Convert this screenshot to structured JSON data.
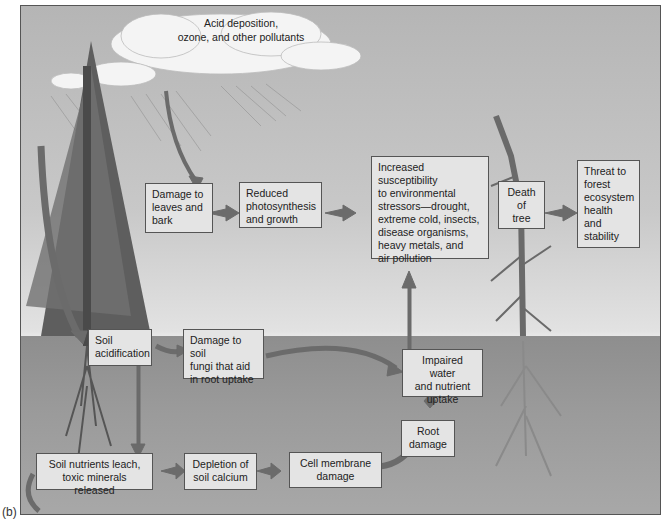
{
  "figure_label": "(b)",
  "cloud": {
    "text_line1": "Acid deposition,",
    "text_line2": "ozone, and other pollutants"
  },
  "boxes": {
    "damage_leaves": [
      "Damage to",
      "leaves and",
      "bark"
    ],
    "reduced_photo": [
      "Reduced",
      "photosynthesis",
      "and growth"
    ],
    "susceptibility": [
      "Increased susceptibility",
      "to environmental",
      "stressors—drought,",
      "extreme cold, insects,",
      "disease organisms,",
      "heavy metals, and",
      "air pollution"
    ],
    "death_tree": [
      "Death",
      "of",
      "tree"
    ],
    "threat": [
      "Threat to",
      "forest",
      "ecosystem",
      "health",
      "and",
      "stability"
    ],
    "soil_acid": [
      "Soil",
      "acidification"
    ],
    "damage_fungi": [
      "Damage to soil",
      "fungi that aid",
      "in root uptake"
    ],
    "impaired": [
      "Impaired water",
      "and nutrient",
      "uptake"
    ],
    "root_damage": [
      "Root",
      "damage"
    ],
    "leach": [
      "Soil nutrients leach,",
      "toxic minerals released"
    ],
    "calcium": [
      "Depletion of",
      "soil calcium"
    ],
    "membrane": [
      "Cell membrane",
      "damage"
    ]
  },
  "colors": {
    "box_fill": "#e4e4e4",
    "arrow": "#6b6b6b",
    "sky": "#c8c8c8",
    "soil": "#9a9a9a"
  }
}
